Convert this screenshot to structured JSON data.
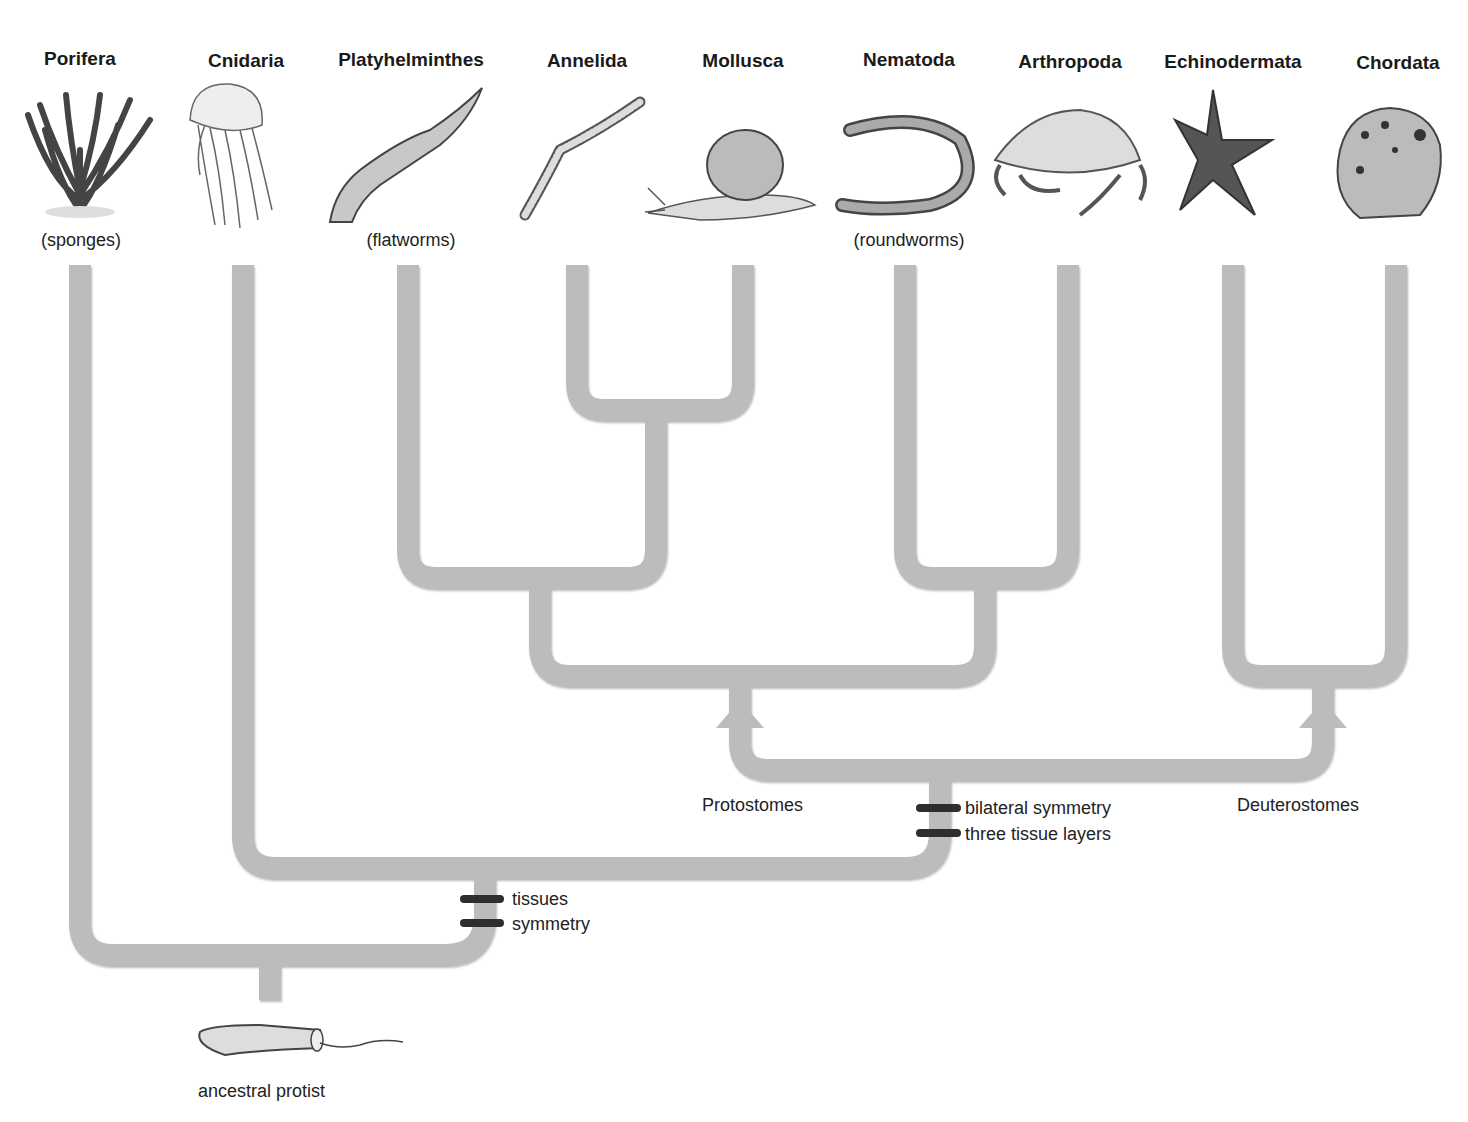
{
  "diagram": {
    "type": "phylogenetic-tree",
    "colors": {
      "branch": "#b9b9b9",
      "branch_shadow": "#9a9a9a",
      "marker": "#2e2e2e",
      "text": "#1a1a1a"
    }
  },
  "phyla": [
    {
      "name": "Porifera",
      "common": "(sponges)",
      "icon": "sponge-icon"
    },
    {
      "name": "Cnidaria",
      "common": "",
      "icon": "jellyfish-icon"
    },
    {
      "name": "Platyhelminthes",
      "common": "(flatworms)",
      "icon": "flatworm-icon"
    },
    {
      "name": "Annelida",
      "common": "",
      "icon": "segmented-worm-icon"
    },
    {
      "name": "Mollusca",
      "common": "",
      "icon": "snail-icon"
    },
    {
      "name": "Nematoda",
      "common": "(roundworms)",
      "icon": "roundworm-icon"
    },
    {
      "name": "Arthropoda",
      "common": "",
      "icon": "crab-icon"
    },
    {
      "name": "Echinodermata",
      "common": "",
      "icon": "starfish-icon"
    },
    {
      "name": "Chordata",
      "common": "",
      "icon": "frog-icon"
    }
  ],
  "groups": {
    "protostomes": "Protostomes",
    "deuterostomes": "Deuterostomes"
  },
  "traits": {
    "node1": [
      "tissues",
      "symmetry"
    ],
    "node2": [
      "bilateral symmetry",
      "three tissue layers"
    ]
  },
  "root": {
    "label": "ancestral protist",
    "icon": "protist-icon"
  }
}
